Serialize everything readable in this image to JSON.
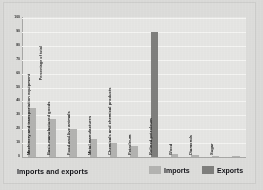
{
  "chart_data": {
    "type": "bar",
    "title": "Imports and exports",
    "xlabel": "",
    "ylabel": "Percentage of total",
    "ylim": [
      0,
      100
    ],
    "yticks": [
      0,
      10,
      20,
      30,
      40,
      50,
      60,
      70,
      80,
      90,
      100
    ],
    "grid": true,
    "legend_position": "bottom-right",
    "categories": [
      "Machinery and transportation equipment",
      "Basic manufactured goods",
      "Food and live animals",
      "Metal manufactures",
      "Chemicals and chemical products",
      "Petroleum",
      "Refined petroleum",
      "Wood",
      "Diamonds",
      "Sugar",
      ""
    ],
    "series": [
      {
        "name": "Imports",
        "color": "#b4b4b2",
        "values": [
          35,
          27,
          20,
          13,
          10,
          8,
          0,
          2,
          1.5,
          1,
          0.6
        ]
      },
      {
        "name": "Exports",
        "color": "#7f7f7d",
        "values": [
          0,
          0,
          0,
          0,
          0,
          0,
          90,
          0,
          0,
          0,
          0
        ]
      }
    ]
  },
  "legend": {
    "imports_label": "Imports",
    "exports_label": "Exports"
  },
  "footer": {
    "title": "Imports and exports"
  },
  "axis": {
    "y_title": "Percentage of total"
  }
}
